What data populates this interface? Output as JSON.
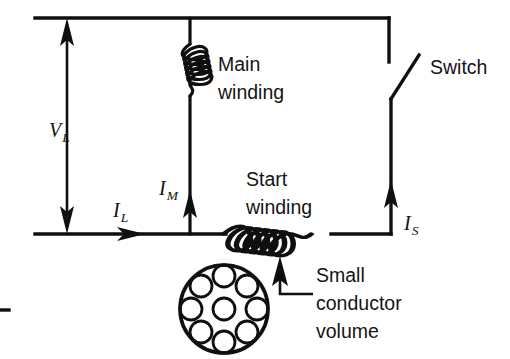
{
  "diagram": {
    "title": "Single-phase motor start/main winding circuit",
    "background_color": "#ffffff",
    "line_color": "#0f0f0f",
    "labels": {
      "main_winding_line1": "Main",
      "main_winding_line2": "winding",
      "start_winding_line1": "Start",
      "start_winding_line2": "winding",
      "switch": "Switch",
      "small_conductor_line1": "Small",
      "small_conductor_line2": "conductor",
      "small_conductor_line3": "volume"
    },
    "quantities": [
      {
        "name": "supply-voltage",
        "symbol": "V",
        "subscript": "L",
        "kind": "voltage",
        "arrow": "double-vertical"
      },
      {
        "name": "line-current",
        "symbol": "I",
        "subscript": "L",
        "kind": "current",
        "arrow": "right"
      },
      {
        "name": "main-winding-current",
        "symbol": "I",
        "subscript": "M",
        "kind": "current",
        "arrow": "up"
      },
      {
        "name": "start-winding-current",
        "symbol": "I",
        "subscript": "S",
        "kind": "current",
        "arrow": "up"
      }
    ],
    "components": {
      "main_winding": {
        "type": "inductor-coil",
        "orientation": "vertical",
        "turns": 6
      },
      "start_winding": {
        "type": "inductor-coil",
        "orientation": "horizontal",
        "turns": 6
      },
      "switch": {
        "type": "single-pole-switch",
        "state": "open"
      },
      "conductor_cross_section": {
        "type": "stranded-conductor",
        "outer_strands": 8,
        "center_strands": 1,
        "total_strands": 9
      }
    }
  }
}
